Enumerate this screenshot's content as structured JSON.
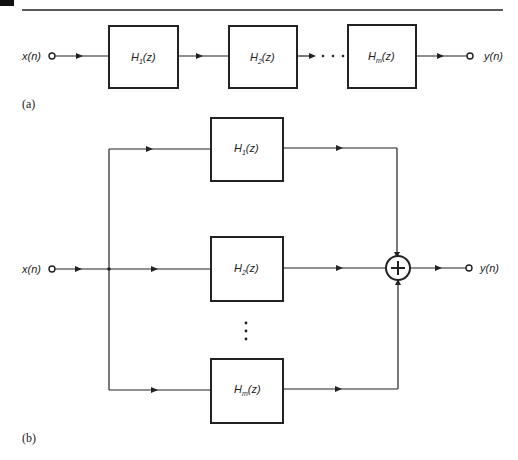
{
  "figure_a": {
    "caption": "(a)",
    "input_label": "x(n)",
    "output_label": "y(n)",
    "blocks": [
      {
        "name": "H",
        "sub": "1",
        "arg": "(z)"
      },
      {
        "name": "H",
        "sub": "2",
        "arg": "(z)"
      },
      {
        "name": "H",
        "sub": "m",
        "arg": "(z)"
      }
    ],
    "ellipsis": "· · ·"
  },
  "figure_b": {
    "caption": "(b)",
    "input_label": "x(n)",
    "output_label": "y(n)",
    "blocks": [
      {
        "name": "H",
        "sub": "1",
        "arg": "(z)"
      },
      {
        "name": "H",
        "sub": "2",
        "arg": "(z)"
      },
      {
        "name": "H",
        "sub": "m",
        "arg": "(z)"
      }
    ],
    "summer_symbol": "+"
  }
}
